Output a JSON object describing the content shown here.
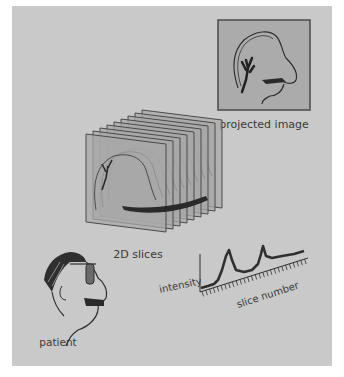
{
  "diagram": {
    "colors": {
      "background": "#c9c9c9",
      "slice_fill": "#a8a8a8",
      "slice_stroke": "#4a4a4a",
      "line": "#2f2f2f",
      "text": "#3a3a3a",
      "projection_fill": "#ababab"
    },
    "nodes": [
      {
        "id": "projected_image",
        "label": "projected image"
      },
      {
        "id": "slices",
        "label": "2D slices"
      },
      {
        "id": "patient",
        "label": "patient"
      },
      {
        "id": "plot",
        "label": "intensity vs slice number plot"
      }
    ],
    "plot": {
      "y_label": "intensity",
      "x_label": "slice number"
    }
  }
}
